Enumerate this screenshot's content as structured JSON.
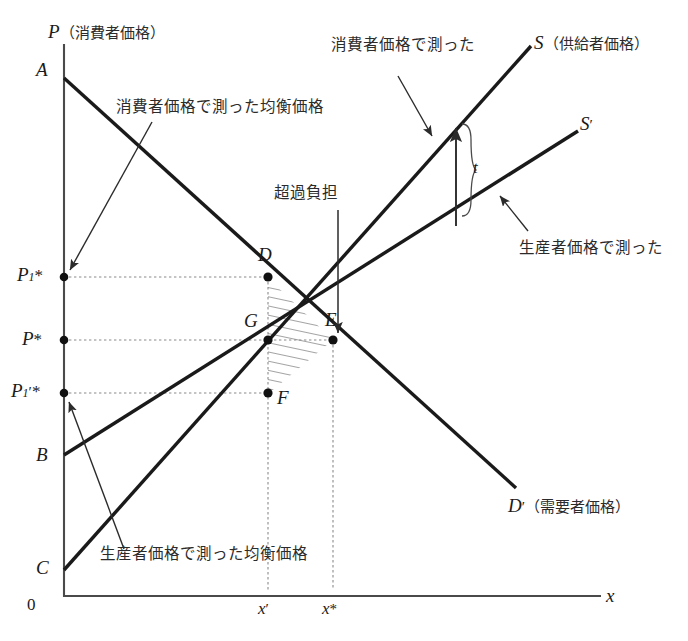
{
  "figure": {
    "type": "economics-supply-demand-tax-diagram",
    "axes": {
      "y_axis_symbol": "P",
      "y_axis_note": "（消費者価格）",
      "x_axis_symbol": "x",
      "origin_label": "0"
    },
    "curve_labels": {
      "supply_consumer_symbol": "S",
      "supply_consumer_note": "（供給者価格）",
      "supply_producer_symbol": "S",
      "supply_producer_prime": "′",
      "demand_symbol": "D",
      "demand_prime": "′",
      "demand_note": "（需要者価格）"
    },
    "intercepts": {
      "demand_top": "A",
      "supply_consumer_intercept": "B",
      "supply_producer_intercept": "C"
    },
    "points": [
      {
        "name": "D",
        "label": "D"
      },
      {
        "name": "G",
        "label": "G"
      },
      {
        "name": "E",
        "label": "E"
      },
      {
        "name": "F",
        "label": "F"
      }
    ],
    "price_ticks": [
      {
        "id": "p1star",
        "base": "P",
        "sub": "1",
        "star": "*",
        "prime": ""
      },
      {
        "id": "pstar",
        "base": "P",
        "sub": "",
        "star": "*",
        "prime": ""
      },
      {
        "id": "p1primestar",
        "base": "P",
        "sub": "1",
        "star": "*",
        "prime": "′"
      }
    ],
    "quantity_ticks": [
      {
        "id": "xprime",
        "base": "x",
        "mark": "′"
      },
      {
        "id": "xstar",
        "base": "x",
        "mark": "*"
      }
    ],
    "annotations": {
      "tax_symbol": "t",
      "excess_burden": "超過負担",
      "measured_in_consumer_price": "消費者価格で測った",
      "measured_in_producer_price": "生産者価格で測った",
      "equilibrium_consumer_price": "消費者価格で測った均衡価格",
      "equilibrium_producer_price": "生産者価格で測った均衡価格"
    },
    "colors": {
      "line": "#1a1a1a",
      "axis": "#4a4a4a",
      "dotted": "#8a8a8a",
      "hatch": "#333333",
      "text": "#2b2b2b"
    }
  }
}
